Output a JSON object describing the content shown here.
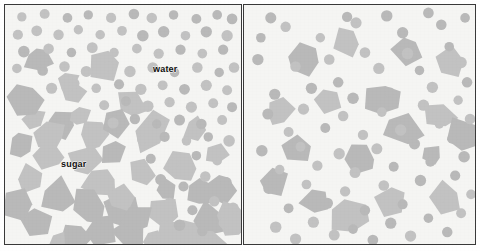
{
  "figure": {
    "width": 480,
    "height": 251,
    "background_color": "#ffffff",
    "panel_background_color": "#f5f5f3",
    "border_color": "#3a3a3a"
  },
  "legend": {
    "water_label": "water",
    "sugar_label": "sugar",
    "water_shape": "circle",
    "sugar_shape": "polygon"
  },
  "colors": {
    "particle_fill": "#b9b9b9",
    "particle_fill_light": "#c2c2c2",
    "label_text": "#101010"
  },
  "panels": [
    {
      "name": "undissolved",
      "caption": "",
      "water_count": 74,
      "sugar_count": 44
    },
    {
      "name": "dissolved",
      "caption": "",
      "water_count": 62,
      "sugar_count": 18
    }
  ],
  "chart_data": {
    "type": "scatter",
    "xlabel": "",
    "ylabel": "",
    "panel_width": 238,
    "panel_height": 241,
    "series": [
      {
        "name": "water",
        "panel": "undissolved",
        "marker": "circle",
        "radius": 5.2,
        "fill": "#b9b9b9",
        "points": [
          [
            17,
            12
          ],
          [
            40,
            9
          ],
          [
            63,
            13
          ],
          [
            84,
            10
          ],
          [
            107,
            13
          ],
          [
            130,
            9
          ],
          [
            148,
            13
          ],
          [
            170,
            10
          ],
          [
            193,
            14
          ],
          [
            214,
            10
          ],
          [
            229,
            14
          ],
          [
            13,
            30
          ],
          [
            32,
            26
          ],
          [
            54,
            30
          ],
          [
            74,
            25
          ],
          [
            96,
            30
          ],
          [
            118,
            26
          ],
          [
            139,
            31
          ],
          [
            160,
            27
          ],
          [
            182,
            31
          ],
          [
            203,
            27
          ],
          [
            224,
            31
          ],
          [
            19,
            47
          ],
          [
            44,
            44
          ],
          [
            67,
            48
          ],
          [
            88,
            43
          ],
          [
            110,
            48
          ],
          [
            133,
            44
          ],
          [
            155,
            49
          ],
          [
            177,
            45
          ],
          [
            199,
            49
          ],
          [
            220,
            45
          ],
          [
            12,
            64
          ],
          [
            38,
            66
          ],
          [
            60,
            62
          ],
          [
            82,
            67
          ],
          [
            104,
            62
          ],
          [
            126,
            67
          ],
          [
            149,
            63
          ],
          [
            171,
            68
          ],
          [
            194,
            63
          ],
          [
            216,
            68
          ],
          [
            231,
            63
          ],
          [
            47,
            84
          ],
          [
            70,
            79
          ],
          [
            92,
            84
          ],
          [
            115,
            80
          ],
          [
            137,
            85
          ],
          [
            159,
            81
          ],
          [
            181,
            85
          ],
          [
            203,
            81
          ],
          [
            224,
            86
          ],
          [
            100,
            101
          ],
          [
            122,
            97
          ],
          [
            144,
            102
          ],
          [
            166,
            98
          ],
          [
            188,
            103
          ],
          [
            210,
            99
          ],
          [
            229,
            103
          ],
          [
            109,
            119
          ],
          [
            131,
            115
          ],
          [
            153,
            120
          ],
          [
            176,
            116
          ],
          [
            198,
            120
          ],
          [
            219,
            116
          ],
          [
            138,
            136
          ],
          [
            161,
            133
          ],
          [
            183,
            137
          ],
          [
            205,
            133
          ],
          [
            226,
            137
          ],
          [
            147,
            155
          ],
          [
            170,
            160
          ],
          [
            193,
            152
          ],
          [
            214,
            157
          ],
          [
            157,
            176
          ],
          [
            180,
            183
          ],
          [
            202,
            173
          ],
          [
            223,
            179
          ],
          [
            166,
            200
          ],
          [
            189,
            207
          ],
          [
            211,
            198
          ],
          [
            230,
            205
          ],
          [
            176,
            222
          ],
          [
            199,
            228
          ],
          [
            221,
            220
          ]
        ]
      },
      {
        "name": "sugar",
        "panel": "undissolved",
        "marker": "polygon",
        "fill": "#b9b9b9",
        "points": [
          [
            33,
            55
          ],
          [
            68,
            90
          ],
          [
            57,
            120
          ],
          [
            28,
            115
          ],
          [
            47,
            152
          ],
          [
            25,
            175
          ],
          [
            54,
            195
          ],
          [
            30,
            220
          ],
          [
            96,
            228
          ],
          [
            72,
            235
          ],
          [
            118,
            207
          ],
          [
            95,
            180
          ],
          [
            80,
            158
          ],
          [
            108,
            148
          ],
          [
            90,
            131
          ],
          [
            62,
            77
          ],
          [
            127,
            100
          ],
          [
            146,
            128
          ],
          [
            137,
            170
          ],
          [
            117,
            196
          ],
          [
            160,
            210
          ],
          [
            150,
            235
          ],
          [
            186,
            230
          ],
          [
            205,
            218
          ],
          [
            198,
            190
          ],
          [
            176,
            165
          ],
          [
            214,
            150
          ],
          [
            192,
            125
          ],
          [
            100,
            60
          ],
          [
            22,
            95
          ],
          [
            15,
            140
          ],
          [
            45,
            131
          ],
          [
            75,
            113
          ],
          [
            110,
            120
          ],
          [
            84,
            205
          ],
          [
            124,
            230
          ],
          [
            163,
            187
          ],
          [
            218,
            185
          ],
          [
            228,
            215
          ],
          [
            207,
            240
          ],
          [
            133,
            215
          ],
          [
            168,
            236
          ],
          [
            52,
            240
          ],
          [
            12,
            200
          ]
        ]
      },
      {
        "name": "water",
        "panel": "dissolved",
        "marker": "circle",
        "radius": 5.2,
        "fill": "#b9b9b9",
        "points": [
          [
            27,
            13
          ],
          [
            104,
            12
          ],
          [
            144,
            11
          ],
          [
            186,
            8
          ],
          [
            223,
            13
          ],
          [
            42,
            22
          ],
          [
            77,
            33
          ],
          [
            113,
            18
          ],
          [
            160,
            28
          ],
          [
            199,
            20
          ],
          [
            17,
            33
          ],
          [
            86,
            55
          ],
          [
            122,
            48
          ],
          [
            165,
            49
          ],
          [
            207,
            42
          ],
          [
            14,
            55
          ],
          [
            52,
            62
          ],
          [
            95,
            78
          ],
          [
            136,
            64
          ],
          [
            177,
            66
          ],
          [
            219,
            58
          ],
          [
            31,
            90
          ],
          [
            68,
            84
          ],
          [
            110,
            94
          ],
          [
            147,
            88
          ],
          [
            190,
            83
          ],
          [
            225,
            78
          ],
          [
            24,
            110
          ],
          [
            60,
            105
          ],
          [
            100,
            112
          ],
          [
            139,
            108
          ],
          [
            181,
            101
          ],
          [
            216,
            96
          ],
          [
            45,
            128
          ],
          [
            82,
            124
          ],
          [
            120,
            131
          ],
          [
            158,
            126
          ],
          [
            197,
            120
          ],
          [
            228,
            115
          ],
          [
            18,
            147
          ],
          [
            57,
            143
          ],
          [
            96,
            150
          ],
          [
            134,
            145
          ],
          [
            172,
            140
          ],
          [
            210,
            135
          ],
          [
            36,
            166
          ],
          [
            74,
            162
          ],
          [
            112,
            169
          ],
          [
            151,
            163
          ],
          [
            188,
            158
          ],
          [
            222,
            153
          ],
          [
            25,
            185
          ],
          [
            63,
            181
          ],
          [
            102,
            188
          ],
          [
            141,
            182
          ],
          [
            178,
            177
          ],
          [
            213,
            172
          ],
          [
            45,
            205
          ],
          [
            84,
            200
          ],
          [
            122,
            207
          ],
          [
            160,
            201
          ],
          [
            197,
            196
          ],
          [
            229,
            191
          ],
          [
            32,
            224
          ],
          [
            70,
            219
          ],
          [
            110,
            226
          ],
          [
            148,
            220
          ],
          [
            186,
            215
          ],
          [
            219,
            210
          ],
          [
            52,
            236
          ],
          [
            91,
            232
          ],
          [
            130,
            237
          ],
          [
            168,
            233
          ],
          [
            205,
            229
          ]
        ]
      },
      {
        "name": "sugar",
        "panel": "dissolved",
        "marker": "polygon",
        "fill": "#b9b9b9",
        "points": [
          [
            60,
            55
          ],
          [
            104,
            35
          ],
          [
            165,
            45
          ],
          [
            207,
            58
          ],
          [
            85,
            95
          ],
          [
            140,
            95
          ],
          [
            198,
            110
          ],
          [
            52,
            145
          ],
          [
            118,
            155
          ],
          [
            190,
            152
          ],
          [
            72,
            200
          ],
          [
            148,
            196
          ],
          [
            202,
            195
          ],
          [
            30,
            180
          ],
          [
            160,
            125
          ],
          [
            222,
            130
          ],
          [
            108,
            215
          ],
          [
            35,
            110
          ]
        ]
      }
    ]
  }
}
